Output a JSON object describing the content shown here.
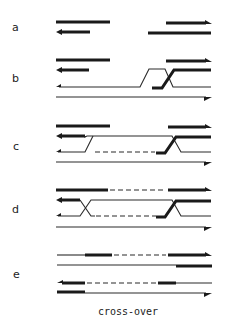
{
  "figure": {
    "panels": [
      {
        "id": "a",
        "label": "a"
      },
      {
        "id": "b",
        "label": "b"
      },
      {
        "id": "c",
        "label": "c"
      },
      {
        "id": "d",
        "label": "d"
      },
      {
        "id": "e",
        "label": "e"
      }
    ],
    "caption": "cross-over",
    "colors": {
      "ink": "#1a1a1a",
      "background": "#ffffff"
    }
  }
}
